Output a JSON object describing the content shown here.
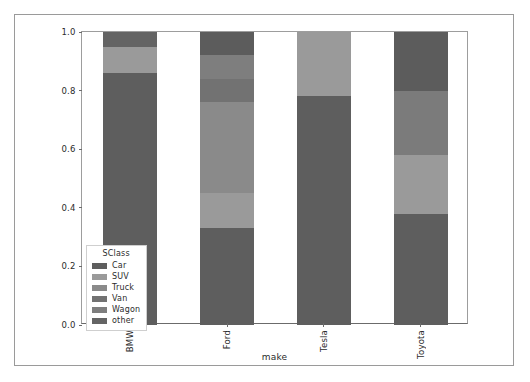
{
  "chart_data": {
    "type": "bar",
    "subtype": "stacked-bar-normalized",
    "title": "",
    "xlabel": "make",
    "ylabel": "",
    "categories": [
      "BMW",
      "Ford",
      "Tesla",
      "Toyota"
    ],
    "ylim": [
      0.0,
      1.0
    ],
    "yticks": [
      "0.0",
      "0.2",
      "0.4",
      "0.6",
      "0.8",
      "1.0"
    ],
    "ytick_values": [
      0.0,
      0.2,
      0.4,
      0.6,
      0.8,
      1.0
    ],
    "grid": false,
    "legend": {
      "title": "SClass",
      "position": "lower-left-inside",
      "entries": [
        {
          "label": "Car",
          "color": "#5e5e5e"
        },
        {
          "label": "SUV",
          "color": "#9a9a9a"
        },
        {
          "label": "Truck",
          "color": "#8a8a8a"
        },
        {
          "label": "Van",
          "color": "#727272"
        },
        {
          "label": "Wagon",
          "color": "#7e7e7e"
        },
        {
          "label": "other",
          "color": "#646464"
        }
      ]
    },
    "series": [
      {
        "name": "Car",
        "color": "#5e5e5e",
        "values": [
          0.86,
          0.33,
          0.78,
          0.38
        ]
      },
      {
        "name": "SUV",
        "color": "#9a9a9a",
        "values": [
          0.09,
          0.12,
          0.22,
          0.2
        ]
      },
      {
        "name": "Truck",
        "color": "#8a8a8a",
        "values": [
          0.0,
          0.31,
          0.0,
          0.22
        ]
      },
      {
        "name": "Van",
        "color": "#727272",
        "values": [
          0.0,
          0.08,
          0.0,
          0.0
        ]
      },
      {
        "name": "Wagon",
        "color": "#7e7e7e",
        "values": [
          0.0,
          0.08,
          0.0,
          0.0
        ]
      },
      {
        "name": "other",
        "color": "#646464",
        "values": [
          0.05,
          0.08,
          0.0,
          0.2
        ]
      }
    ],
    "stacks": [
      {
        "category": "BMW",
        "segments": [
          {
            "name": "Car",
            "value": 0.86,
            "y0": 0.0,
            "y1": 0.86,
            "color": "#5e5e5e"
          },
          {
            "name": "SUV",
            "value": 0.09,
            "y0": 0.86,
            "y1": 0.95,
            "color": "#9a9a9a"
          },
          {
            "name": "other",
            "value": 0.05,
            "y0": 0.95,
            "y1": 1.0,
            "color": "#646464"
          }
        ]
      },
      {
        "category": "Ford",
        "segments": [
          {
            "name": "Car",
            "value": 0.33,
            "y0": 0.0,
            "y1": 0.33,
            "color": "#5e5e5e"
          },
          {
            "name": "SUV",
            "value": 0.12,
            "y0": 0.33,
            "y1": 0.45,
            "color": "#9a9a9a"
          },
          {
            "name": "Truck",
            "value": 0.31,
            "y0": 0.45,
            "y1": 0.76,
            "color": "#8a8a8a"
          },
          {
            "name": "Van",
            "value": 0.08,
            "y0": 0.76,
            "y1": 0.84,
            "color": "#727272"
          },
          {
            "name": "Wagon",
            "value": 0.08,
            "y0": 0.84,
            "y1": 0.92,
            "color": "#7e7e7e"
          },
          {
            "name": "other",
            "value": 0.08,
            "y0": 0.92,
            "y1": 1.0,
            "color": "#5c5c5c"
          }
        ]
      },
      {
        "category": "Tesla",
        "segments": [
          {
            "name": "Car",
            "value": 0.78,
            "y0": 0.0,
            "y1": 0.78,
            "color": "#5e5e5e"
          },
          {
            "name": "SUV",
            "value": 0.22,
            "y0": 0.78,
            "y1": 1.0,
            "color": "#9a9a9a"
          }
        ]
      },
      {
        "category": "Toyota",
        "segments": [
          {
            "name": "Car",
            "value": 0.38,
            "y0": 0.0,
            "y1": 0.38,
            "color": "#5e5e5e"
          },
          {
            "name": "SUV",
            "value": 0.2,
            "y0": 0.38,
            "y1": 0.58,
            "color": "#9a9a9a"
          },
          {
            "name": "Truck",
            "value": 0.22,
            "y0": 0.58,
            "y1": 0.8,
            "color": "#7b7b7b"
          },
          {
            "name": "other",
            "value": 0.2,
            "y0": 0.8,
            "y1": 1.0,
            "color": "#5c5c5c"
          }
        ]
      }
    ]
  }
}
